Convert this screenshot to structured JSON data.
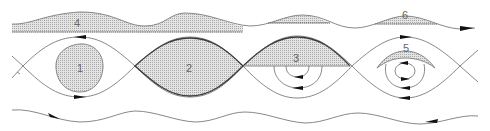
{
  "figure": {
    "type": "streamline diagram",
    "colors": {
      "line": "#7a7a7a",
      "bold_line": "#3a3a3a",
      "shade": "#c8c8c8",
      "arrow": "#111111",
      "background": "#ffffff"
    }
  },
  "regions": [
    {
      "id": "1",
      "label": "1",
      "description": "closed blob inside first cat's-eye cell"
    },
    {
      "id": "2",
      "label": "2",
      "description": "fully shaded lens cell between X-points"
    },
    {
      "id": "3",
      "label": "3",
      "description": "upper half of third cell shaded, nested circulations below"
    },
    {
      "id": "4",
      "label": "4",
      "description": "shaded area under top wave over flat baseline"
    },
    {
      "id": "5",
      "label": "5",
      "description": "crescent region above vortex center in fourth cell"
    },
    {
      "id": "6",
      "label": "6",
      "description": "thin shaded crests on right half of top wave"
    }
  ],
  "arrows": [
    {
      "location": "top wave right end",
      "direction": "right"
    },
    {
      "location": "cell 1 top separatrix",
      "direction": "left"
    },
    {
      "location": "cell 1 bottom separatrix",
      "direction": "right"
    },
    {
      "location": "cell 3 inner loops",
      "direction": "left"
    },
    {
      "location": "cell 4 top separatrix",
      "direction": "right"
    },
    {
      "location": "cell 4 inner loops",
      "direction": "mixed"
    },
    {
      "location": "cell 4 bottom separatrix",
      "direction": "left"
    },
    {
      "location": "bottom wave left",
      "direction": "right"
    },
    {
      "location": "bottom wave right",
      "direction": "left"
    }
  ]
}
